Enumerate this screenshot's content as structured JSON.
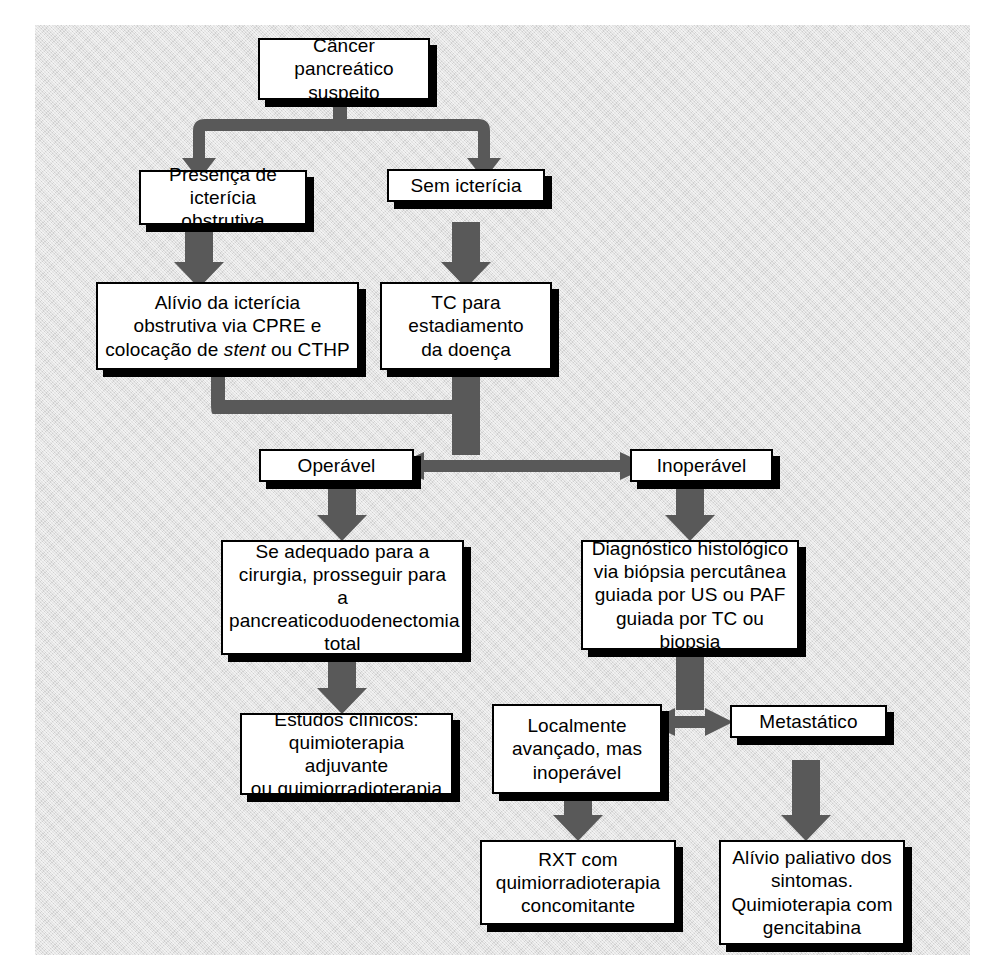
{
  "diagram": {
    "language": "pt-BR",
    "background_color": "#e2e2e2",
    "box_fill_color": "#ffffff",
    "box_border_color": "#000000",
    "box_shadow_color": "#000000",
    "arrow_color": "#595959"
  },
  "nodes": {
    "suspected": {
      "line1": "Câncer pancreático",
      "line2": "suspeito"
    },
    "jaundice_yes": {
      "line1": "Presença de",
      "line2": "icterícia obstrutiva"
    },
    "jaundice_no": {
      "line1": "Sem icterícia"
    },
    "relief": {
      "line1": "Alívio da icterícia",
      "line2": "obstrutiva via CPRE e",
      "line3_a": "colocação de ",
      "line3_italic": "stent",
      "line3_b": " ou CTHP"
    },
    "ct_staging": {
      "line1": "TC para",
      "line2": "estadiamento",
      "line3": "da doença"
    },
    "operable": {
      "line1": "Operável"
    },
    "inoperable": {
      "line1": "Inoperável"
    },
    "surgery": {
      "line1": "Se adequado para a",
      "line2": "cirurgia, prosseguir para",
      "line3": "a pancreaticoduodenectomia",
      "line4": "total"
    },
    "histology": {
      "line1": "Diagnóstico histológico",
      "line2": "via biópsia percutânea",
      "line3": "guiada por US ou PAF",
      "line4": "guiada por TC ou biopsia"
    },
    "trials": {
      "line1": "Estudos clínicos:",
      "line2": "quimioterapia adjuvante",
      "line3": "ou quimiorradioterapia"
    },
    "locally_advanced": {
      "line1": "Localmente",
      "line2": "avançado, mas",
      "line3": "inoperável"
    },
    "metastatic": {
      "line1": "Metastático"
    },
    "rxt": {
      "line1": "RXT com",
      "line2": "quimiorradioterapia",
      "line3": "concomitante"
    },
    "palliative": {
      "line1": "Alívio paliativo dos",
      "line2": "sintomas.",
      "line3": "Quimioterapia com",
      "line4": "gencitabina"
    }
  },
  "edges": [
    {
      "from": "suspected",
      "to": "jaundice_yes",
      "style": "fork-down-arrow"
    },
    {
      "from": "suspected",
      "to": "jaundice_no",
      "style": "fork-down-arrow"
    },
    {
      "from": "jaundice_yes",
      "to": "relief",
      "style": "straight-down-arrow"
    },
    {
      "from": "jaundice_no",
      "to": "ct_staging",
      "style": "straight-down-arrow"
    },
    {
      "from": "relief",
      "to": "ct_staging_junction",
      "style": "elbow-right"
    },
    {
      "from": "ct_staging",
      "to": "operable",
      "style": "split-left-arrow"
    },
    {
      "from": "ct_staging",
      "to": "inoperable",
      "style": "split-right-arrow"
    },
    {
      "from": "operable",
      "to": "surgery",
      "style": "straight-down-arrow"
    },
    {
      "from": "inoperable",
      "to": "histology",
      "style": "straight-down-arrow"
    },
    {
      "from": "surgery",
      "to": "trials",
      "style": "straight-down-arrow"
    },
    {
      "from": "histology",
      "to": "locally_advanced",
      "style": "split-left-arrow"
    },
    {
      "from": "histology",
      "to": "metastatic",
      "style": "split-right-arrow"
    },
    {
      "from": "locally_advanced",
      "to": "rxt",
      "style": "straight-down-arrow"
    },
    {
      "from": "metastatic",
      "to": "palliative",
      "style": "straight-down-arrow"
    }
  ]
}
